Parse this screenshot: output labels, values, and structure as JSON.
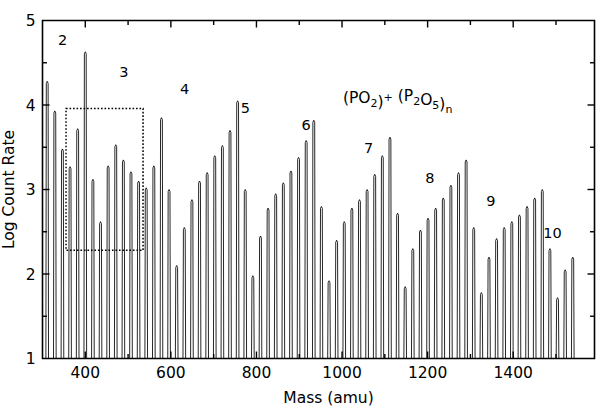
{
  "chart_data": {
    "type": "line",
    "title": "",
    "xlabel": "Mass (amu)",
    "ylabel": "Log Count Rate",
    "xlim": [
      300,
      1590
    ],
    "ylim": [
      1,
      5
    ],
    "grid": false,
    "legend": "none",
    "x_ticks": [
      400,
      600,
      800,
      1000,
      1200,
      1400
    ],
    "x_tick_labels": [
      "400",
      "600",
      "800",
      "1000",
      "1200",
      "1400"
    ],
    "x_minor_ticks": [
      300,
      500,
      700,
      900,
      1100,
      1300,
      1500
    ],
    "y_ticks": [
      1,
      2,
      3,
      4,
      5
    ],
    "y_tick_labels": [
      "1",
      "2",
      "3",
      "4",
      "5"
    ],
    "y_minor_ticks": [
      1.5,
      2.5,
      3.5,
      4.5
    ],
    "annotation": {
      "text": "(PO2)+ (P2O5)n",
      "parts": [
        {
          "t": "(PO",
          "style": "normal"
        },
        {
          "t": "2",
          "style": "sub"
        },
        {
          "t": ")",
          "style": "normal"
        },
        {
          "t": "+",
          "style": "sup"
        },
        {
          "t": " (P",
          "style": "normal"
        },
        {
          "t": "2",
          "style": "sub"
        },
        {
          "t": "O",
          "style": "normal"
        },
        {
          "t": "5",
          "style": "sub"
        },
        {
          "t": ")",
          "style": "normal"
        },
        {
          "t": "n",
          "style": "sub"
        }
      ],
      "x": 1130,
      "y": 4.02
    },
    "highlight_box": {
      "x0": 355,
      "x1": 535,
      "y0": 2.28,
      "y1": 3.96,
      "style": "dotted"
    },
    "series_peak_labels": [
      {
        "label": "2",
        "mass": 347,
        "y": 4.63
      },
      {
        "label": "3",
        "mass": 490,
        "y": 4.25
      },
      {
        "label": "4",
        "mass": 632,
        "y": 4.05
      },
      {
        "label": "5",
        "mass": 774,
        "y": 3.82
      },
      {
        "label": "6",
        "mass": 916,
        "y": 3.62
      },
      {
        "label": "7",
        "mass": 1062,
        "y": 3.35
      },
      {
        "label": "8",
        "mass": 1205,
        "y": 3.0
      },
      {
        "label": "9",
        "mass": 1348,
        "y": 2.72
      },
      {
        "label": "10",
        "mass": 1492,
        "y": 2.34
      }
    ],
    "peak_spacing_amu": 17.8,
    "cluster_spacing_amu": 142,
    "comb": {
      "first_peak_mass": 311,
      "n_peaks": 72,
      "baseline_log": 1.0,
      "peak_half_width_amu": 3.1,
      "envelope_description": "Series of sharp mass peaks spaced ~17.8 amu; envelope maxima recur every ~142 amu (P2O5 unit) and decay from log 4.6 at n=2 to log 2.3 at n=10",
      "peak_heights_log": [
        4.28,
        3.93,
        3.48,
        3.27,
        3.72,
        4.63,
        3.12,
        2.62,
        3.28,
        3.53,
        3.35,
        3.21,
        3.1,
        3.02,
        3.28,
        3.85,
        3.0,
        2.1,
        2.55,
        2.88,
        3.1,
        3.2,
        3.4,
        3.52,
        3.7,
        4.05,
        3.0,
        1.98,
        2.45,
        2.78,
        2.95,
        3.08,
        3.22,
        3.38,
        3.58,
        3.82,
        2.8,
        1.92,
        2.4,
        2.62,
        2.78,
        2.88,
        3.0,
        3.18,
        3.4,
        3.62,
        2.72,
        1.85,
        2.3,
        2.52,
        2.66,
        2.78,
        2.9,
        3.05,
        3.2,
        3.35,
        2.55,
        1.78,
        2.2,
        2.42,
        2.55,
        2.62,
        2.7,
        2.8,
        2.9,
        3.0,
        2.3,
        1.72,
        2.05,
        2.2
      ]
    }
  },
  "axes": {
    "ylabel": "Log Count Rate",
    "xlabel": "Mass (amu)"
  }
}
